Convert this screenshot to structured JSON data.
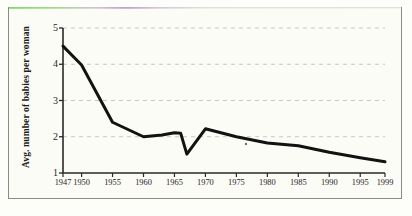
{
  "chart_data": {
    "type": "line",
    "title": "",
    "subtitle": "",
    "xlabel": "",
    "ylabel": "Avg. number of babies per woman",
    "xlim": [
      1947,
      1999
    ],
    "ylim": [
      1,
      5
    ],
    "yticks": [
      1,
      2,
      3,
      4,
      5
    ],
    "ytick_labels": [
      "1",
      "2",
      "3",
      "4",
      "5"
    ],
    "xticks": [
      1947,
      1950,
      1955,
      1960,
      1965,
      1970,
      1975,
      1980,
      1985,
      1990,
      1995,
      1999
    ],
    "xtick_labels": [
      "1947",
      "1950",
      "1955",
      "1960",
      "1965",
      "1970",
      "1975",
      "1980",
      "1985",
      "1990",
      "1995",
      "1999"
    ],
    "grid": "horizontal-dashed",
    "legend": "none",
    "series": [
      {
        "name": "Avg. number of babies per woman",
        "color": "#141210",
        "line_width": 3,
        "x": [
          1947,
          1950,
          1955,
          1960,
          1963,
          1965,
          1966,
          1967,
          1970,
          1975,
          1980,
          1985,
          1990,
          1995,
          1999
        ],
        "values": [
          4.5,
          3.98,
          2.4,
          2.0,
          2.05,
          2.11,
          2.1,
          1.52,
          2.22,
          2.0,
          1.83,
          1.75,
          1.57,
          1.42,
          1.31
        ]
      }
    ],
    "annotations": []
  },
  "figure": {
    "background_color": "#fdfdf9",
    "frame_color": "#8a8a86",
    "axis_color": "#2b2823",
    "grid_color": "#c9c6bc"
  }
}
